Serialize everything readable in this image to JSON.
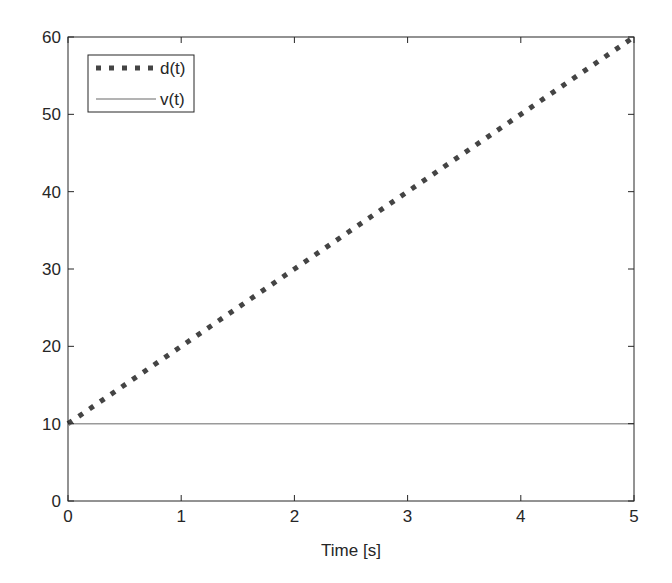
{
  "chart_data": {
    "type": "line",
    "title": "",
    "xlabel": "Time [s]",
    "ylabel": "",
    "xlim": [
      0,
      5
    ],
    "ylim": [
      0,
      60
    ],
    "xticks": [
      0,
      1,
      2,
      3,
      4,
      5
    ],
    "yticks": [
      0,
      10,
      20,
      30,
      40,
      50,
      60
    ],
    "grid": false,
    "box": true,
    "legend_position": "upper left",
    "series": [
      {
        "name": "d(t)",
        "style": "dotted",
        "line_width": 5,
        "color": "#444444",
        "x": [
          0,
          1,
          2,
          3,
          4,
          5
        ],
        "y": [
          10,
          20,
          30,
          40,
          50,
          60
        ]
      },
      {
        "name": "v(t)",
        "style": "solid",
        "line_width": 1.5,
        "color": "#9a9a9a",
        "x": [
          0,
          1,
          2,
          3,
          4,
          5
        ],
        "y": [
          10,
          10,
          10,
          10,
          10,
          10
        ]
      }
    ]
  },
  "colors": {
    "axis": "#262626",
    "background": "#ffffff"
  }
}
